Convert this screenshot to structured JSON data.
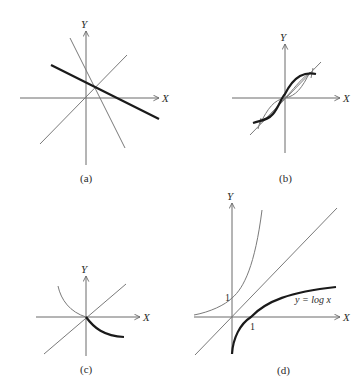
{
  "figure": {
    "panels": [
      {
        "id": "a",
        "caption": "(a)",
        "axis_labels": {
          "x": "X",
          "y": "Y"
        },
        "description": "Two lines symmetric about y = x: thick line with negative slope, its reflection (steep thin line), and the line y = x"
      },
      {
        "id": "b",
        "caption": "(b)",
        "axis_labels": {
          "x": "X",
          "y": "Y"
        },
        "description": "Thick S-shaped curve and its reflection about y = x, intersecting on the line y = x"
      },
      {
        "id": "c",
        "caption": "(c)",
        "axis_labels": {
          "x": "X",
          "y": "Y"
        },
        "description": "Thick decreasing curve from origin and its reflection about y = x"
      },
      {
        "id": "d",
        "caption": "(d)",
        "axis_labels": {
          "x": "X",
          "y": "Y"
        },
        "tick_labels": {
          "x_one": "1",
          "y_one": "1"
        },
        "curve_label": "y = log x",
        "description": "Graph of y = log x (thick), its inverse y = e^x (thin), and the line y = x"
      }
    ]
  }
}
